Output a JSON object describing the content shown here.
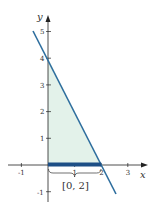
{
  "figure": {
    "x_axis_label": "x",
    "y_axis_label": "y",
    "x_ticks": [
      {
        "value": -1,
        "label": "-1"
      },
      {
        "value": 1,
        "label": "1"
      },
      {
        "value": 2,
        "label": "2"
      },
      {
        "value": 3,
        "label": "3"
      }
    ],
    "y_ticks": [
      {
        "value": 5,
        "label": "5"
      },
      {
        "value": 4,
        "label": "4"
      },
      {
        "value": 3,
        "label": "3"
      },
      {
        "value": 2,
        "label": "2"
      },
      {
        "value": 1,
        "label": "1"
      },
      {
        "value": -1,
        "label": "-1"
      }
    ],
    "interval_label": "[0, 2]",
    "line_equation": "y = 4 - 2x",
    "shaded_region": "triangle with vertices (0,0), (0,4), (2,0)",
    "colors": {
      "line": "#2e6e9e",
      "interval_bar": "#1d4f86",
      "shade": "#e3f2ea",
      "axes": "#222222"
    }
  }
}
